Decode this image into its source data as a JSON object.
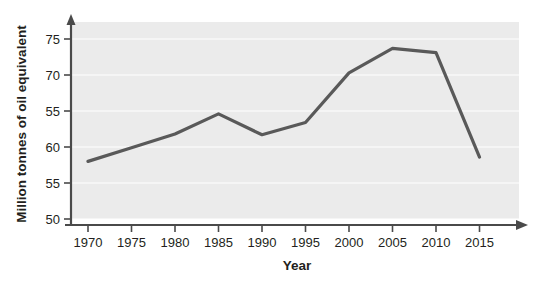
{
  "chart_data": {
    "type": "line",
    "title": "",
    "subtitle": "",
    "xlabel": "Year",
    "ylabel": "Million tonnes of oil equivalent",
    "x": [
      1970,
      1975,
      1980,
      1985,
      1990,
      1995,
      2000,
      2005,
      2010,
      2015
    ],
    "categories": [
      "1970",
      "1975",
      "1980",
      "1985",
      "1990",
      "1995",
      "2000",
      "2005",
      "2010",
      "2015"
    ],
    "values": [
      58.0,
      59.9,
      61.8,
      64.6,
      61.7,
      63.4,
      70.3,
      73.7,
      73.1,
      58.6
    ],
    "series": [
      {
        "name": "Energy consumption",
        "values": [
          58.0,
          59.9,
          61.8,
          64.6,
          61.7,
          63.4,
          70.3,
          73.7,
          73.1,
          58.6
        ],
        "color": "#595959"
      }
    ],
    "xlim": [
      1968,
      2018
    ],
    "ylim": [
      50,
      77
    ],
    "xticks": [
      "1970",
      "1975",
      "1980",
      "1985",
      "1990",
      "1995",
      "2000",
      "2005",
      "2010",
      "2015"
    ],
    "yticks": [
      "50",
      "55",
      "60",
      "55",
      "70",
      "75"
    ],
    "ytick_values": [
      50,
      55,
      60,
      65,
      70,
      75
    ],
    "grid": true,
    "grid_color": "#ffffff",
    "legend": "none",
    "plot_background": "#ebebeb",
    "axis_color": "#4a4a4a",
    "line_color": "#595959"
  },
  "axes": {
    "y_title": "Million tonnes of oil equivalent",
    "x_title": "Year"
  }
}
